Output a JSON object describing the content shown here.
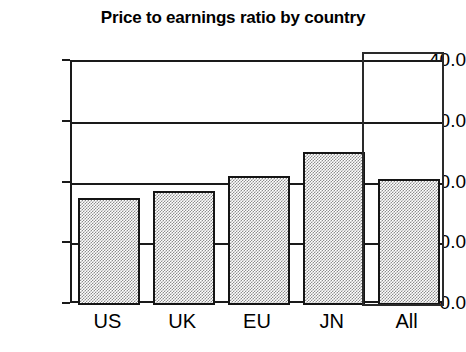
{
  "chart_data": {
    "type": "bar",
    "title": "Price to earnings ratio by country",
    "xlabel": "",
    "ylabel": "",
    "categories": [
      "US",
      "UK",
      "EU",
      "JN",
      "All"
    ],
    "values": [
      17.6,
      18.8,
      21.3,
      25.2,
      20.8
    ],
    "ylim": [
      0.0,
      40.0
    ],
    "ytick_labels": [
      "0.0",
      "10.0",
      "20.0",
      "30.0",
      "40.0"
    ],
    "ytick_values": [
      0.0,
      10.0,
      20.0,
      30.0,
      40.0
    ],
    "grid": true,
    "legend": null,
    "annotations": [
      {
        "name": "highlight-box",
        "target_category": "All",
        "description": "Rectangle outline drawn around the 'All' bar and its label"
      }
    ],
    "style": {
      "bar_fill": "#8d8d8d",
      "bar_fill_pattern": "dither-checker",
      "bar_border": "#141414",
      "axis_color": "#1a1a1a",
      "background": "#ffffff"
    }
  },
  "axis": {
    "y_ticks": [
      {
        "label": "40.0",
        "value": 40.0
      },
      {
        "label": "30.0",
        "value": 30.0
      },
      {
        "label": "20.0",
        "value": 20.0
      },
      {
        "label": "10.0",
        "value": 10.0
      },
      {
        "label": "0.0",
        "value": 0.0
      }
    ],
    "x_ticks": [
      {
        "label": "US"
      },
      {
        "label": "UK"
      },
      {
        "label": "EU"
      },
      {
        "label": "JN"
      },
      {
        "label": "All"
      }
    ]
  }
}
